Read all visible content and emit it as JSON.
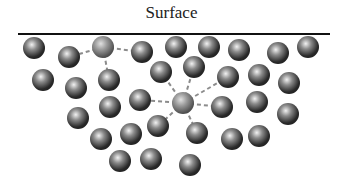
{
  "title": "Surface",
  "surface_line": {
    "x1": 18,
    "x2": 330,
    "y": 34,
    "color": "#111111"
  },
  "molecule_radius": 11,
  "colors": {
    "molecule_dark": "#1e1e1e",
    "molecule_mid": "#6a6a6a",
    "molecule_light": "#f2f2f2",
    "focus_mid": "#8a8a8a",
    "bond": "#8c8c8c"
  },
  "molecules": [
    {
      "x": 34,
      "y": 48
    },
    {
      "x": 69,
      "y": 57
    },
    {
      "x": 103,
      "y": 47,
      "focus": "surface"
    },
    {
      "x": 142,
      "y": 52
    },
    {
      "x": 176,
      "y": 47
    },
    {
      "x": 209,
      "y": 47
    },
    {
      "x": 239,
      "y": 50
    },
    {
      "x": 278,
      "y": 53
    },
    {
      "x": 308,
      "y": 47
    },
    {
      "x": 43,
      "y": 80
    },
    {
      "x": 76,
      "y": 88
    },
    {
      "x": 109,
      "y": 80
    },
    {
      "x": 161,
      "y": 72
    },
    {
      "x": 194,
      "y": 67
    },
    {
      "x": 228,
      "y": 77
    },
    {
      "x": 259,
      "y": 75
    },
    {
      "x": 289,
      "y": 83
    },
    {
      "x": 78,
      "y": 118
    },
    {
      "x": 110,
      "y": 107
    },
    {
      "x": 140,
      "y": 100
    },
    {
      "x": 183,
      "y": 103,
      "focus": "interior"
    },
    {
      "x": 222,
      "y": 107
    },
    {
      "x": 257,
      "y": 102
    },
    {
      "x": 288,
      "y": 114
    },
    {
      "x": 101,
      "y": 139
    },
    {
      "x": 131,
      "y": 134
    },
    {
      "x": 158,
      "y": 126
    },
    {
      "x": 197,
      "y": 133
    },
    {
      "x": 232,
      "y": 139
    },
    {
      "x": 259,
      "y": 136
    },
    {
      "x": 120,
      "y": 161
    },
    {
      "x": 151,
      "y": 159
    },
    {
      "x": 190,
      "y": 165
    }
  ],
  "bonds": [
    {
      "from": [
        103,
        47
      ],
      "to": [
        69,
        57
      ]
    },
    {
      "from": [
        103,
        47
      ],
      "to": [
        142,
        52
      ]
    },
    {
      "from": [
        103,
        47
      ],
      "to": [
        109,
        80
      ]
    },
    {
      "from": [
        183,
        103
      ],
      "to": [
        161,
        72
      ]
    },
    {
      "from": [
        183,
        103
      ],
      "to": [
        194,
        67
      ]
    },
    {
      "from": [
        183,
        103
      ],
      "to": [
        228,
        77
      ]
    },
    {
      "from": [
        183,
        103
      ],
      "to": [
        140,
        100
      ]
    },
    {
      "from": [
        183,
        103
      ],
      "to": [
        222,
        107
      ]
    },
    {
      "from": [
        183,
        103
      ],
      "to": [
        158,
        126
      ]
    },
    {
      "from": [
        183,
        103
      ],
      "to": [
        197,
        133
      ]
    }
  ]
}
